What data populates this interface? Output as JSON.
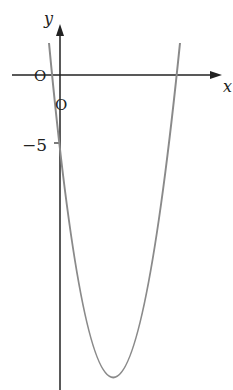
{
  "graph": {
    "x_axis_label": "x",
    "y_axis_label": "y",
    "origin_label": "O",
    "y_intercept_marker": "O",
    "tick_label": "−5",
    "curve_color": "#8a8a8a",
    "axis_color": "#222222"
  }
}
